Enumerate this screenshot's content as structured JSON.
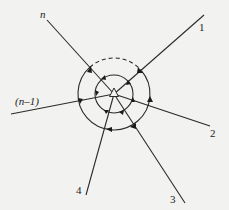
{
  "diagram": {
    "type": "node-with-branches-and-loops",
    "center": {
      "x": 114,
      "y": 94,
      "marker": "triangle"
    },
    "outer_circle": {
      "r": 36,
      "dashed_arc": "top, between branch n and branch 1"
    },
    "inner_circle": {
      "r": 19
    },
    "branches": [
      {
        "id": "n",
        "label": "n",
        "end": {
          "x": 47,
          "y": 20
        },
        "label_pos": {
          "x": 40,
          "y": 18
        },
        "italic": true
      },
      {
        "id": "1",
        "label": "1",
        "end": {
          "x": 204,
          "y": 15
        },
        "label_pos": {
          "x": 200,
          "y": 31
        },
        "italic": false
      },
      {
        "id": "n-1",
        "label": "(n–1)",
        "end": {
          "x": 11,
          "y": 114
        },
        "label_pos": {
          "x": 15,
          "y": 106
        },
        "italic": true
      },
      {
        "id": "2",
        "label": "2",
        "end": {
          "x": 210,
          "y": 126
        },
        "label_pos": {
          "x": 210,
          "y": 137
        },
        "italic": false
      },
      {
        "id": "3",
        "label": "3",
        "end": {
          "x": 185,
          "y": 203
        },
        "label_pos": {
          "x": 170,
          "y": 203
        },
        "italic": false
      },
      {
        "id": "4",
        "label": "4",
        "end": {
          "x": 86,
          "y": 195
        },
        "label_pos": {
          "x": 76,
          "y": 194
        },
        "italic": false
      }
    ]
  },
  "labels": {
    "n": "n",
    "one": "1",
    "n_minus_1": "(n–1)",
    "two": "2",
    "three": "3",
    "four": "4"
  },
  "colors": {
    "background": "#f2f2f0",
    "stroke": "#2a2a2a"
  }
}
